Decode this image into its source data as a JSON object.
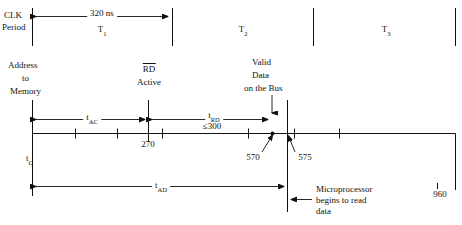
{
  "diagram": {
    "type": "timing-diagram",
    "width": 462,
    "height": 225,
    "stroke_color": "#111111",
    "background_color": "#ffffff"
  },
  "clk_row": {
    "row_label_line1": "CLK",
    "row_label_line2": "Period",
    "span_label": "320 ns",
    "states": [
      {
        "name": "T",
        "index": "1"
      },
      {
        "name": "T",
        "index": "2"
      },
      {
        "name": "T",
        "index": "3"
      }
    ]
  },
  "signals": {
    "address": {
      "line1": "Address",
      "line2": "to",
      "line3": "Memory"
    },
    "rd": {
      "line1": "RD",
      "line1_overline": true,
      "line2": "Active"
    },
    "valid_data": {
      "line1": "Valid",
      "line2": "Data",
      "line3": "on the Bus"
    }
  },
  "intervals": {
    "t_ac": {
      "name": "t",
      "sub": "AC"
    },
    "t_rd": {
      "name": "t",
      "sub": "RD",
      "constraint": "≤300"
    },
    "t_o": {
      "name": "t",
      "sub": "O"
    },
    "t_ad": {
      "name": "t",
      "sub": "AD"
    }
  },
  "axis": {
    "ticks": [
      {
        "value": "270",
        "show_label": true
      },
      {
        "value": "570",
        "show_label": true
      },
      {
        "value": "575",
        "show_label": true
      },
      {
        "value": "960",
        "show_label": true
      }
    ]
  },
  "annotations": {
    "micro_read": {
      "line1": "Microprocessor",
      "line2": "begins to read",
      "line3": "data"
    }
  }
}
